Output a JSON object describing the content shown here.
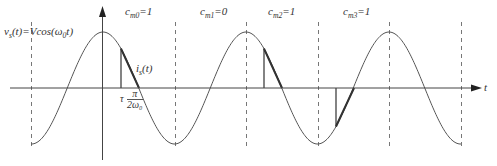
{
  "figure": {
    "signal_label": {
      "base": "v",
      "sub": "s",
      "rest": "(t)=Vcos(ω",
      "sub2": "0",
      "end": "t)"
    },
    "current_label": {
      "base": "i",
      "sub": "s",
      "rest": "(t)"
    },
    "tau_label": "τ",
    "fraction": {
      "num": "π",
      "den": "2ω₀"
    },
    "time_axis_label": "t",
    "coefficients": [
      {
        "name": "c",
        "sub": "m0",
        "value": "=1"
      },
      {
        "name": "c",
        "sub": "m1",
        "value": "=0"
      },
      {
        "name": "c",
        "sub": "m2",
        "value": "=1"
      },
      {
        "name": "c",
        "sub": "m3",
        "value": "=1"
      }
    ]
  },
  "colors": {
    "curve": "#555555",
    "axis": "#444444",
    "dashed": "#777777",
    "pulse": "#333333",
    "text": "#333333"
  },
  "geometry": {
    "origin_x": 103,
    "axis_y": 88,
    "amplitude_px": 56,
    "period_px": 143,
    "dashed_x": [
      31,
      103,
      175,
      246,
      318,
      389,
      461
    ],
    "pulses": [
      {
        "start_x": 121,
        "end_x": 139,
        "sign": 1
      },
      {
        "start_x": 264,
        "end_x": 282,
        "sign": 1
      },
      {
        "start_x": 336,
        "end_x": 354,
        "sign": -1
      }
    ]
  }
}
